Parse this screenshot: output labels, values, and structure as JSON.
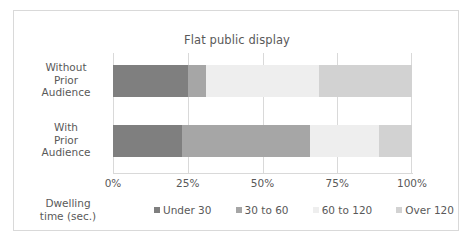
{
  "chart_data": {
    "type": "bar",
    "orientation": "horizontal",
    "stacked": true,
    "normalized_percent": true,
    "title": "Flat public display",
    "xlabel": "",
    "ylabel": "Dwelling time (sec.)",
    "axis_title": "Dwelling time (sec.)",
    "categories": [
      "Without Prior Audience",
      "With Prior Audience"
    ],
    "category_lines": [
      [
        "Without",
        "Prior",
        "Audience"
      ],
      [
        "With",
        "Prior",
        "Audience"
      ]
    ],
    "series": [
      {
        "name": "Under 30",
        "color": "#7f7f7f",
        "values": [
          25,
          23
        ]
      },
      {
        "name": "30 to 60",
        "color": "#a6a6a6",
        "values": [
          6,
          43
        ]
      },
      {
        "name": "60 to 120",
        "color": "#eeeeee",
        "values": [
          38,
          23
        ]
      },
      {
        "name": "Over 120",
        "color": "#d2d2d2",
        "values": [
          31,
          11
        ]
      }
    ],
    "xlim": [
      0,
      100
    ],
    "xticks": [
      0,
      25,
      50,
      75,
      100
    ],
    "xtick_labels": [
      "0%",
      "25%",
      "50%",
      "75%",
      "100%"
    ],
    "grid": "vertical",
    "legend_position": "bottom",
    "legend": [
      "Under 30",
      "30 to 60",
      "60 to 120",
      "Over 120"
    ],
    "colors": {
      "frame_border": "#d9d9d9",
      "gridline": "#d9d9d9",
      "text": "#595959",
      "background": "#ffffff"
    }
  }
}
